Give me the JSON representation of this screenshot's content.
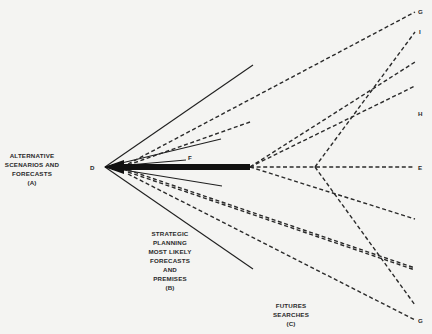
{
  "diagram": {
    "title": "",
    "labels": {
      "alternative": "ALTERNATIVE\nSCENARIOS AND\nFORECASTS\n(A)",
      "strategic": "STRATEGIC\nPLANNING\nMOST LIKELY\nFORECASTS\nAND\nPREMISES\n(B)",
      "futures": "FUTURES\nSEARCHES\n(C)"
    },
    "points": {
      "D": "D",
      "F": "F",
      "G_top": "G",
      "I": "I",
      "H": "H",
      "E": "E",
      "G_bottom": "G"
    },
    "nodes": {
      "origin": {
        "name": "D",
        "x": 105,
        "y": 167
      },
      "bar_end": {
        "x": 250,
        "y": 167
      },
      "branch": {
        "x": 315,
        "y": 167
      }
    },
    "solid_rays": [
      {
        "from": "D",
        "to": [
          253,
          65
        ]
      },
      {
        "from": "D",
        "to": [
          221,
          139
        ]
      },
      {
        "from": "D",
        "to": [
          186,
          160
        ],
        "label": "F"
      },
      {
        "from": "D",
        "to": [
          222,
          186
        ]
      },
      {
        "from": "D",
        "to": [
          253,
          269
        ]
      }
    ],
    "thick_path": {
      "from": "D",
      "to": [
        250,
        167
      ],
      "label": "Strategic planning most likely forecasts"
    },
    "dashed_rays": [
      {
        "from": [
          128,
          164
        ],
        "to": [
          415,
          12
        ],
        "label": "G"
      },
      {
        "from": [
          250,
          167
        ],
        "to": [
          415,
          62
        ]
      },
      {
        "from": [
          250,
          167
        ],
        "to": [
          415,
          86
        ],
        "label": "H"
      },
      {
        "from": [
          250,
          167
        ],
        "to": [
          415,
          167
        ],
        "label": "E"
      },
      {
        "from": [
          250,
          167
        ],
        "to": [
          415,
          219
        ]
      },
      {
        "from": [
          128,
          172
        ],
        "to": [
          415,
          270
        ]
      },
      {
        "from": [
          128,
          174
        ],
        "to": [
          415,
          320
        ],
        "label": "G"
      },
      {
        "from": [
          315,
          167
        ],
        "to": [
          415,
          32
        ],
        "label": "I"
      },
      {
        "from": [
          315,
          167
        ],
        "to": [
          415,
          305
        ]
      }
    ],
    "colors": {
      "background": "#f4f4f2",
      "ink": "#1f1f1f"
    }
  }
}
